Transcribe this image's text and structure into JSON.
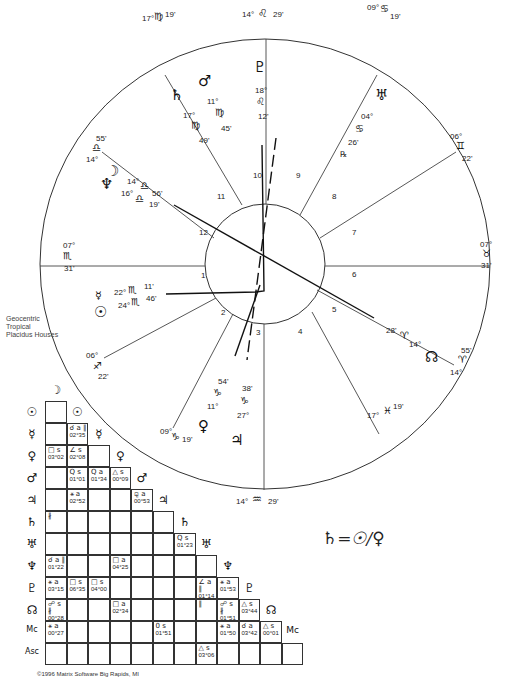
{
  "chart_info": {
    "lines": [
      "Geocentric",
      "Tropical",
      "Placidus Houses"
    ],
    "copyright": "©1996 Matrix Software Big Rapids, MI",
    "formula": "♄=☉/♀"
  },
  "house_cusps": [
    {
      "house": "MC/10",
      "deg": "14°",
      "sign": "♌",
      "min": "29'"
    },
    {
      "house": "11",
      "deg": "09°",
      "sign": "♋",
      "min": "19'"
    },
    {
      "house": "12",
      "deg": "06°",
      "sign": "♊",
      "min": "22'"
    },
    {
      "house": "DSC/7",
      "deg": "07°",
      "sign": "♉",
      "min": "31'"
    },
    {
      "house": "8",
      "deg": "14°",
      "sign": "♈",
      "min": "55'"
    },
    {
      "house": "9",
      "deg": "17°",
      "sign": "♓",
      "min": "19'"
    },
    {
      "house": "IC/4",
      "deg": "14°",
      "sign": "♒",
      "min": "29'"
    },
    {
      "house": "5",
      "deg": "09°",
      "sign": "♑",
      "min": "19'"
    },
    {
      "house": "6",
      "deg": "06°",
      "sign": "♐",
      "min": "22'"
    },
    {
      "house": "ASC/1",
      "deg": "07°",
      "sign": "♏",
      "min": "31'"
    },
    {
      "house": "2",
      "deg": "14°",
      "sign": "♎",
      "min": "55'"
    },
    {
      "house": "3",
      "deg": "17°",
      "sign": "♍",
      "min": "19'"
    }
  ],
  "house_numbers": [
    "1",
    "2",
    "3",
    "4",
    "5",
    "6",
    "7",
    "8",
    "9",
    "10",
    "11",
    "12"
  ],
  "planets": [
    {
      "name": "Pluto",
      "glyph": "♇",
      "deg": "18°",
      "sign": "♌",
      "min": "12'"
    },
    {
      "name": "Mars",
      "glyph": "♂",
      "deg": "11°",
      "sign": "♍",
      "min": "45'"
    },
    {
      "name": "Saturn",
      "glyph": "♄",
      "deg": "17°",
      "sign": "♍",
      "min": "49'"
    },
    {
      "name": "Uranus",
      "glyph": "♅",
      "deg": "04°",
      "sign": "♋",
      "min": "26'",
      "retro": "℞"
    },
    {
      "name": "Moon",
      "glyph": "☽",
      "deg": "14°",
      "sign": "♎",
      "min": "56'"
    },
    {
      "name": "Neptune",
      "glyph": "♆",
      "deg": "16°",
      "sign": "♎",
      "min": "19'"
    },
    {
      "name": "Mercury",
      "glyph": "☿",
      "deg": "22°",
      "sign": "♏",
      "min": "11'"
    },
    {
      "name": "Sun",
      "glyph": "☉",
      "deg": "24°",
      "sign": "♏",
      "min": "46'"
    },
    {
      "name": "Venus",
      "glyph": "♀",
      "deg": "11°",
      "sign": "♑",
      "min": "54'"
    },
    {
      "name": "Jupiter",
      "glyph": "♃",
      "deg": "27°",
      "sign": "♑",
      "min": "38'"
    },
    {
      "name": "North Node",
      "glyph": "☊",
      "deg": "14°",
      "sign": "♈",
      "min": "28'"
    }
  ],
  "aspect_grid": {
    "columns": [
      "☽",
      "☉",
      "☿",
      "♀",
      "♂",
      "♃",
      "♄",
      "♅",
      "♆",
      "♇",
      "☊",
      "Mc"
    ],
    "rows": [
      "☉",
      "☿",
      "♀",
      "♂",
      "♃",
      "♄",
      "♅",
      "♆",
      "♇",
      "☊",
      "Mc",
      "Asc"
    ],
    "cells": [
      {
        "r": 1,
        "c": 1,
        "asp": "☌ a ∥",
        "orb": "02°35"
      },
      {
        "r": 2,
        "c": 0,
        "asp": "□ s",
        "orb": "03°02"
      },
      {
        "r": 2,
        "c": 1,
        "asp": "∠ s",
        "orb": "02°08"
      },
      {
        "r": 3,
        "c": 1,
        "asp": "Q s",
        "orb": "01°01"
      },
      {
        "r": 3,
        "c": 2,
        "asp": "Q a",
        "orb": "01°34"
      },
      {
        "r": 3,
        "c": 3,
        "asp": "△ s",
        "orb": "00°09"
      },
      {
        "r": 4,
        "c": 1,
        "asp": "⚹ a",
        "orb": "02°52"
      },
      {
        "r": 4,
        "c": 4,
        "asp": "⚼ a",
        "orb": "00°53"
      },
      {
        "r": 5,
        "c": 0,
        "asp": "∦",
        "orb": ""
      },
      {
        "r": 6,
        "c": 6,
        "asp": "Q s",
        "orb": "01°23"
      },
      {
        "r": 7,
        "c": 0,
        "asp": "☌ a ∥",
        "orb": "01°22"
      },
      {
        "r": 7,
        "c": 3,
        "asp": "□ a",
        "orb": "04°25"
      },
      {
        "r": 8,
        "c": 0,
        "asp": "⚹ a",
        "orb": "03°15"
      },
      {
        "r": 8,
        "c": 1,
        "asp": "□ s",
        "orb": "06°35"
      },
      {
        "r": 8,
        "c": 2,
        "asp": "□ s",
        "orb": "04°00"
      },
      {
        "r": 8,
        "c": 7,
        "asp": "∠ a ∥",
        "orb": "01°14"
      },
      {
        "r": 8,
        "c": 8,
        "asp": "⚹ a",
        "orb": "01°53"
      },
      {
        "r": 9,
        "c": 0,
        "asp": "☍ s ∦",
        "orb": "00°28"
      },
      {
        "r": 9,
        "c": 3,
        "asp": "□ a",
        "orb": "02°34"
      },
      {
        "r": 9,
        "c": 7,
        "asp": "∥",
        "orb": ""
      },
      {
        "r": 9,
        "c": 8,
        "asp": "☍ s ∦",
        "orb": "01°51"
      },
      {
        "r": 9,
        "c": 9,
        "asp": "△ s",
        "orb": "03°44"
      },
      {
        "r": 10,
        "c": 0,
        "asp": "⚹ a",
        "orb": "00°27"
      },
      {
        "r": 10,
        "c": 5,
        "asp": "0 s",
        "orb": "01°51"
      },
      {
        "r": 10,
        "c": 8,
        "asp": "⚹ a",
        "orb": "01°50"
      },
      {
        "r": 10,
        "c": 9,
        "asp": "☌ a",
        "orb": "03°42"
      },
      {
        "r": 10,
        "c": 10,
        "asp": "△ s",
        "orb": "00°01"
      },
      {
        "r": 11,
        "c": 7,
        "asp": "△ s",
        "orb": "03°06"
      }
    ]
  }
}
